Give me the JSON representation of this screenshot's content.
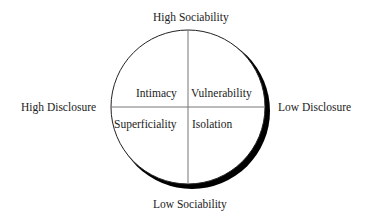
{
  "diagram": {
    "axes": {
      "top": "High Sociability",
      "bottom": "Low Sociability",
      "left": "High Disclosure",
      "right": "Low Disclosure"
    },
    "quadrants": {
      "top_left": "Intimacy",
      "top_right": "Vulnerability",
      "bottom_left": "Superficiality",
      "bottom_right": "Isolation"
    },
    "colors": {
      "stroke": "#222222",
      "shadow": "#000000",
      "divider": "#777777"
    }
  }
}
